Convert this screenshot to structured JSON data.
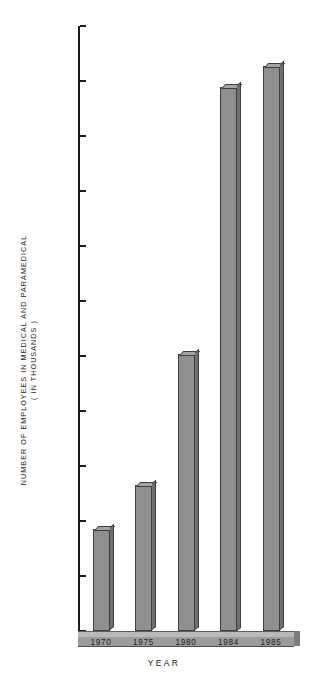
{
  "chart_data": {
    "type": "bar",
    "title": "",
    "categories": [
      "1970",
      "1975",
      "1980",
      "1984",
      "1985"
    ],
    "values": [
      9.3,
      13.3,
      25.2,
      49.5,
      51.4
    ],
    "xlabel": "YEAR",
    "ylabel_line1": "NUMBER OF EMPLOYEES IN MEDICAL AND PARAMEDICAL",
    "ylabel_line2": "( IN THOUSANDS )",
    "ylim": [
      0,
      55
    ],
    "ytick_step": 5,
    "yticks": [
      "0",
      "5",
      "10",
      "15",
      "20",
      "25",
      "30",
      "35",
      "40",
      "45",
      "50",
      "55"
    ],
    "grid": false,
    "legend": null,
    "bar_color": "#8f8f8f",
    "bar_edge_color": "#3d3d3d",
    "axis_color": "#1c1c1c",
    "background": "#ffffff"
  },
  "corner": {
    "mark": ""
  }
}
